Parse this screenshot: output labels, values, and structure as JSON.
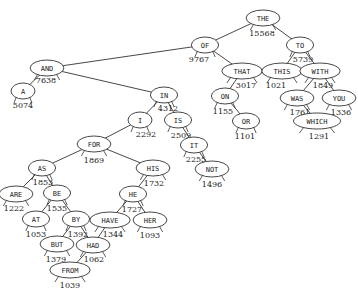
{
  "diagram": {
    "type": "binary-search-tree",
    "edge_color": "#333333",
    "node_stroke": "#333333",
    "node_fill": "#ffffff",
    "nodes": [
      {
        "id": "THE",
        "x": 263,
        "y": 18,
        "count": "15568",
        "cx": 262,
        "cy": 36
      },
      {
        "id": "OF",
        "x": 205,
        "y": 45,
        "count": "9767",
        "cx": 199,
        "cy": 62
      },
      {
        "id": "TO",
        "x": 300,
        "y": 45,
        "count": "5739",
        "cx": 303,
        "cy": 62
      },
      {
        "id": "AND",
        "x": 47,
        "y": 68,
        "count": "7638",
        "cx": 46,
        "cy": 83
      },
      {
        "id": "THAT",
        "x": 242,
        "y": 71,
        "count": "3017",
        "cx": 246,
        "cy": 88
      },
      {
        "id": "THIS",
        "x": 282,
        "y": 71,
        "count": "1021",
        "cx": 276,
        "cy": 88
      },
      {
        "id": "WITH",
        "x": 320,
        "y": 71,
        "count": "1849",
        "cx": 323,
        "cy": 88
      },
      {
        "id": "A",
        "x": 23,
        "y": 91,
        "count": "5074",
        "cx": 23,
        "cy": 108
      },
      {
        "id": "IN",
        "x": 164,
        "y": 95,
        "count": "4312",
        "cx": 168,
        "cy": 111
      },
      {
        "id": "ON",
        "x": 225,
        "y": 96,
        "count": "1155",
        "cx": 223,
        "cy": 114
      },
      {
        "id": "WAS",
        "x": 297,
        "y": 98,
        "count": "1761",
        "cx": 300,
        "cy": 115
      },
      {
        "id": "YOU",
        "x": 339,
        "y": 98,
        "count": "1336",
        "cx": 341,
        "cy": 115
      },
      {
        "id": "I",
        "x": 140,
        "y": 120,
        "count": "2292",
        "cx": 146,
        "cy": 137
      },
      {
        "id": "IS",
        "x": 178,
        "y": 120,
        "count": "2509",
        "cx": 181,
        "cy": 138
      },
      {
        "id": "OR",
        "x": 246,
        "y": 121,
        "count": "1101",
        "cx": 245,
        "cy": 139
      },
      {
        "id": "WHICH",
        "x": 317,
        "y": 121,
        "count": "1291",
        "cx": 319,
        "cy": 139
      },
      {
        "id": "FOR",
        "x": 94,
        "y": 144,
        "count": "1869",
        "cx": 94,
        "cy": 163
      },
      {
        "id": "IT",
        "x": 194,
        "y": 145,
        "count": "2255",
        "cx": 196,
        "cy": 162
      },
      {
        "id": "AS",
        "x": 42,
        "y": 168,
        "count": "1853",
        "cx": 43,
        "cy": 185
      },
      {
        "id": "HIS",
        "x": 153,
        "y": 168,
        "count": "1732",
        "cx": 154,
        "cy": 186
      },
      {
        "id": "NOT",
        "x": 212,
        "y": 169,
        "count": "1496",
        "cx": 212,
        "cy": 187
      },
      {
        "id": "ARE",
        "x": 16,
        "y": 194,
        "count": "1222",
        "cx": 14,
        "cy": 211
      },
      {
        "id": "BE",
        "x": 57,
        "y": 193,
        "count": "1535",
        "cx": 57,
        "cy": 211
      },
      {
        "id": "HE",
        "x": 133,
        "y": 194,
        "count": "1727",
        "cx": 132,
        "cy": 212
      },
      {
        "id": "AT",
        "x": 36,
        "y": 219,
        "count": "1053",
        "cx": 36,
        "cy": 237
      },
      {
        "id": "BY",
        "x": 76,
        "y": 219,
        "count": "1392",
        "cx": 78,
        "cy": 237
      },
      {
        "id": "HAVE",
        "x": 110,
        "y": 220,
        "count": "1344",
        "cx": 113,
        "cy": 237
      },
      {
        "id": "HER",
        "x": 150,
        "y": 220,
        "count": "1093",
        "cx": 150,
        "cy": 238
      },
      {
        "id": "BUT",
        "x": 57,
        "y": 244,
        "count": "1379",
        "cx": 56,
        "cy": 262
      },
      {
        "id": "HAD",
        "x": 93,
        "y": 245,
        "count": "1062",
        "cx": 94,
        "cy": 262
      },
      {
        "id": "FROM",
        "x": 70,
        "y": 270,
        "count": "1039",
        "cx": 70,
        "cy": 288
      }
    ],
    "edges": [
      [
        "THE",
        "OF"
      ],
      [
        "THE",
        "TO"
      ],
      [
        "OF",
        "AND"
      ],
      [
        "OF",
        "THAT"
      ],
      [
        "TO",
        "THIS"
      ],
      [
        "TO",
        "WITH"
      ],
      [
        "AND",
        "A"
      ],
      [
        "AND",
        "IN"
      ],
      [
        "THAT",
        "ON"
      ],
      [
        "ON",
        "OR"
      ],
      [
        "WITH",
        "WAS"
      ],
      [
        "WITH",
        "YOU"
      ],
      [
        "WAS",
        "WHICH"
      ],
      [
        "IN",
        "I"
      ],
      [
        "IN",
        "IS"
      ],
      [
        "I",
        "FOR"
      ],
      [
        "IS",
        "IT"
      ],
      [
        "IT",
        "NOT"
      ],
      [
        "FOR",
        "AS"
      ],
      [
        "FOR",
        "HIS"
      ],
      [
        "AS",
        "ARE"
      ],
      [
        "AS",
        "BE"
      ],
      [
        "BE",
        "AT"
      ],
      [
        "BE",
        "BY"
      ],
      [
        "BY",
        "BUT"
      ],
      [
        "BY",
        "HAD"
      ],
      [
        "HIS",
        "HE"
      ],
      [
        "HE",
        "HAVE"
      ],
      [
        "HE",
        "HER"
      ],
      [
        "HAVE",
        "HAD"
      ],
      [
        "HAD",
        "FROM"
      ]
    ]
  }
}
